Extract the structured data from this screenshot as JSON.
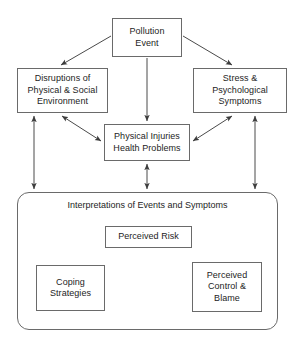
{
  "diagram": {
    "type": "flow-diagram",
    "stroke_color": "#6a6a6a",
    "arrow_color": "#4a4a4a",
    "text_color": "#242424",
    "background_color": "#ffffff",
    "nodes": [
      {
        "id": "pollution-event",
        "label": "Pollution\nEvent"
      },
      {
        "id": "disruptions",
        "label": "Disruptions of\nPhysical & Social\nEnvironment"
      },
      {
        "id": "stress",
        "label": "Stress &\nPsychological\nSymptoms"
      },
      {
        "id": "physical",
        "label": "Physical Injuries\nHealth Problems"
      },
      {
        "id": "perceived-risk",
        "label": "Perceived Risk"
      },
      {
        "id": "coping",
        "label": "Coping\nStrategies"
      },
      {
        "id": "control-blame",
        "label": "Perceived\nControl &\nBlame"
      }
    ],
    "group": {
      "id": "interpretations",
      "label": "Interpretations of Events and Symptoms"
    },
    "edges": [
      {
        "from": "pollution-event",
        "to": "disruptions",
        "style": "single"
      },
      {
        "from": "pollution-event",
        "to": "stress",
        "style": "single"
      },
      {
        "from": "pollution-event",
        "to": "physical",
        "style": "single"
      },
      {
        "from": "disruptions",
        "to": "physical",
        "style": "double"
      },
      {
        "from": "stress",
        "to": "physical",
        "style": "double"
      },
      {
        "from": "disruptions",
        "to": "interpretations",
        "style": "double"
      },
      {
        "from": "physical",
        "to": "interpretations",
        "style": "double"
      },
      {
        "from": "stress",
        "to": "interpretations",
        "style": "double"
      },
      {
        "from": "perceived-risk",
        "to": "coping",
        "style": "double"
      },
      {
        "from": "perceived-risk",
        "to": "control-blame",
        "style": "double"
      },
      {
        "from": "coping",
        "to": "control-blame",
        "style": "double"
      }
    ]
  }
}
